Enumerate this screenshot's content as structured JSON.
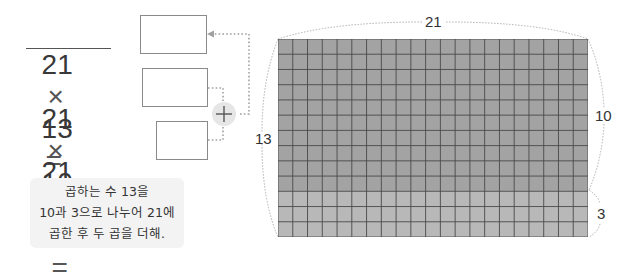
{
  "equations": [
    {
      "left": "21",
      "operator": "×",
      "right": "13",
      "equals": "=",
      "underlined": true
    },
    {
      "left": "21",
      "operator": "×",
      "right": "10",
      "equals": "=",
      "underlined": false
    },
    {
      "left": "21",
      "operator": "×",
      "right": "3",
      "equals": "=",
      "underlined": false
    }
  ],
  "answer_boxes": [
    {
      "value": ""
    },
    {
      "value": ""
    },
    {
      "value": ""
    }
  ],
  "plus_symbol": "+",
  "note": {
    "line1": "곱하는 수 13을",
    "line2": "10과 3으로 나누어 21에",
    "line3": "곱한 후 두 곱을 더해."
  },
  "grid": {
    "columns": 21,
    "rows": 13,
    "upper_rows": 10,
    "lower_rows": 3,
    "upper_color": "#a3a3a3",
    "lower_color": "#b8b8b8",
    "line_color": "#4a4a4a"
  },
  "labels": {
    "top": "21",
    "left": "13",
    "right_upper": "10",
    "right_lower": "3"
  }
}
